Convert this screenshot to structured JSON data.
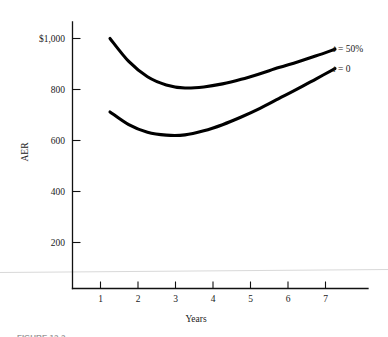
{
  "figure": {
    "caption_sliver": "FIGURE 12-2",
    "background_color": "#ffffff",
    "ink_color": "#000000"
  },
  "chart_data": {
    "type": "line",
    "title": "",
    "xlabel": "Years",
    "ylabel": "AER",
    "xlim": [
      0,
      7.8
    ],
    "ylim": [
      0,
      1100
    ],
    "grid": false,
    "legend_position": "right-of-curve-ends",
    "x_tick_labels": [
      "1",
      "2",
      "3",
      "4",
      "5",
      "6",
      "7"
    ],
    "x_ticks": [
      1,
      2,
      3,
      4,
      5,
      6,
      7
    ],
    "y_ticks": [
      200,
      400,
      600,
      800,
      1000
    ],
    "y_tick_labels": [
      "200",
      "400",
      "600",
      "800",
      "$1,000"
    ],
    "series": [
      {
        "name": "t = 50%",
        "label_prefix": "t",
        "label_suffix": " = 50%",
        "x": [
          1,
          1.5,
          2,
          2.5,
          3,
          3.5,
          4,
          4.5,
          5,
          5.5,
          6,
          6.5,
          7
        ],
        "values": [
          1000,
          910,
          850,
          818,
          806,
          810,
          822,
          840,
          862,
          886,
          908,
          932,
          958
        ]
      },
      {
        "name": "t = 0",
        "label_prefix": "t",
        "label_suffix": " = 0",
        "x": [
          1,
          1.5,
          2,
          2.5,
          3,
          3.5,
          4,
          4.5,
          5,
          5.5,
          6,
          6.5,
          7
        ],
        "values": [
          712,
          662,
          632,
          621,
          622,
          638,
          662,
          692,
          726,
          764,
          802,
          842,
          882
        ]
      }
    ]
  }
}
